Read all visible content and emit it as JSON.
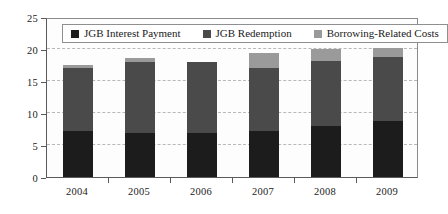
{
  "chart_data": {
    "type": "bar",
    "subtype": "stacked-bar",
    "title": "",
    "xlabel": "",
    "ylabel": "",
    "categories": [
      "2004",
      "2005",
      "2006",
      "2007",
      "2008",
      "2009"
    ],
    "series": [
      {
        "name": "JGB Interest Payment",
        "color": "#1c1c1c",
        "values": [
          7.2,
          6.8,
          6.9,
          7.2,
          7.9,
          8.8
        ]
      },
      {
        "name": "JGB Redemption",
        "color": "#4a4a4a",
        "values": [
          9.8,
          11.2,
          11.0,
          9.8,
          10.3,
          9.9
        ]
      },
      {
        "name": "Borrowing-Related Costs",
        "color": "#9a9a9a",
        "values": [
          0.5,
          0.6,
          0.1,
          2.3,
          1.8,
          1.5
        ]
      }
    ],
    "totals": [
      17.5,
      18.6,
      18.0,
      19.3,
      20.0,
      20.2
    ],
    "ylim": [
      0,
      25
    ],
    "yticks": [
      0,
      5,
      10,
      15,
      20,
      25
    ],
    "ytick_labels": [
      "0",
      "5",
      "10",
      "15",
      "20",
      "25"
    ],
    "grid": "horizontal-dashed",
    "gridline_values": [
      5,
      10,
      15,
      20
    ],
    "legend_position": "top-inside"
  },
  "legend": {
    "items": [
      {
        "label": "JGB Interest Payment",
        "color": "#1c1c1c"
      },
      {
        "label": "JGB Redemption",
        "color": "#4a4a4a"
      },
      {
        "label": "Borrowing-Related Costs",
        "color": "#9a9a9a"
      }
    ]
  }
}
